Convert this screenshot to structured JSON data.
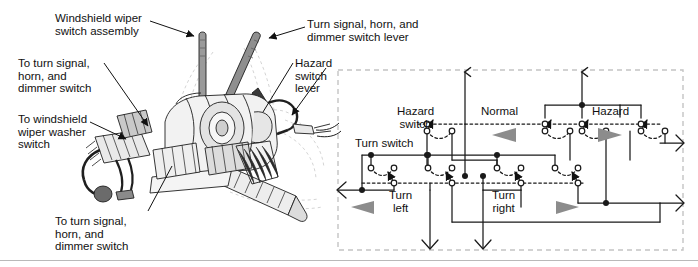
{
  "figure": {
    "background_color": "#ffffff",
    "line_color": "#1a1a1a",
    "gray_arrow_color": "#8c8c8c",
    "dashed_box_color": "#c4c4c4"
  },
  "illustration": {
    "name": "steering-column-switch-assembly",
    "callouts": [
      {
        "id": "windshield-wiper-switch-assembly",
        "text": "Windshield wiper\nswitch assembly",
        "x": 55,
        "y": 12
      },
      {
        "id": "to-turn-signal-horn-dimmer-upper",
        "text": "To turn signal,\nhorn, and\ndimmer switch",
        "x": 18,
        "y": 57
      },
      {
        "id": "to-windshield-wiper-washer-switch",
        "text": "To windshield\nwiper washer\nswitch",
        "x": 18,
        "y": 113
      },
      {
        "id": "to-turn-signal-horn-dimmer-lower",
        "text": "To turn signal,\nhorn, and\ndimmer switch",
        "x": 55,
        "y": 215
      },
      {
        "id": "turn-signal-horn-dimmer-switch-lever",
        "text": "Turn signal, horn, and\ndimmer switch lever",
        "x": 307,
        "y": 18
      },
      {
        "id": "hazard-switch-lever",
        "text": "Hazard\nswitch\nlever",
        "x": 295,
        "y": 57
      }
    ]
  },
  "schematic": {
    "name": "turn-and-hazard-switch-schematic",
    "box": {
      "x": 338,
      "y": 70,
      "width": 345,
      "height": 180
    },
    "labels": [
      {
        "id": "hazard-switch-label",
        "text": "Hazard\nswitch",
        "x": 397,
        "y": 111,
        "align": "left"
      },
      {
        "id": "normal-label",
        "text": "Normal",
        "x": 485,
        "y": 111
      },
      {
        "id": "hazard-label",
        "text": "Hazard",
        "x": 592,
        "y": 111
      },
      {
        "id": "turn-switch-label",
        "text": "Turn switch",
        "x": 355,
        "y": 143
      },
      {
        "id": "turn-left-label",
        "text": "Turn\nleft",
        "x": 389,
        "y": 196
      },
      {
        "id": "turn-right-label",
        "text": "Turn\nright",
        "x": 492,
        "y": 196
      }
    ],
    "direction_arrows": [
      {
        "id": "normal-gray-arrow-left",
        "direction": "left",
        "x": 490,
        "y": 134
      },
      {
        "id": "hazard-gray-arrow-right",
        "direction": "right",
        "x": 600,
        "y": 134
      },
      {
        "id": "turn-left-gray-arrow",
        "direction": "left",
        "x": 352,
        "y": 207
      },
      {
        "id": "turn-right-gray-arrow",
        "direction": "right",
        "x": 556,
        "y": 207
      }
    ],
    "terminals": [
      {
        "id": "top-terminal-left",
        "direction": "up",
        "x": 465,
        "y": 70
      },
      {
        "id": "top-terminal-right",
        "direction": "up",
        "x": 582,
        "y": 70
      },
      {
        "id": "right-terminal-upper",
        "direction": "right",
        "x": 683,
        "y": 143
      },
      {
        "id": "right-terminal-lower",
        "direction": "right",
        "x": 683,
        "y": 203
      },
      {
        "id": "left-terminal",
        "direction": "left",
        "x": 338,
        "y": 190
      },
      {
        "id": "bottom-terminal-left",
        "direction": "down",
        "x": 430,
        "y": 250
      },
      {
        "id": "bottom-terminal-right",
        "direction": "down",
        "x": 483,
        "y": 250
      }
    ],
    "switch_poles": [
      {
        "id": "hazard-switch-pole-1",
        "x": 427,
        "y": 124
      },
      {
        "id": "hazard-switch-pole-2",
        "x": 545,
        "y": 124
      },
      {
        "id": "hazard-switch-pole-3",
        "x": 582,
        "y": 124
      },
      {
        "id": "hazard-switch-pole-4",
        "x": 641,
        "y": 124
      },
      {
        "id": "turn-switch-pole-1",
        "x": 371,
        "y": 176
      },
      {
        "id": "turn-switch-pole-2",
        "x": 428,
        "y": 176
      },
      {
        "id": "turn-switch-pole-3",
        "x": 497,
        "y": 176
      },
      {
        "id": "turn-switch-pole-4",
        "x": 555,
        "y": 176
      }
    ]
  }
}
